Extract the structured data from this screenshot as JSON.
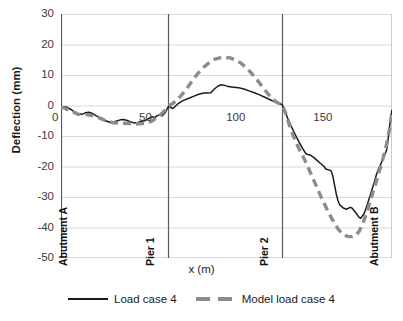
{
  "chart_data": {
    "type": "line",
    "title": "",
    "xlabel": "x (m)",
    "ylabel": "Deflection (mm)",
    "xlim": [
      0,
      190
    ],
    "ylim": [
      -50,
      30
    ],
    "grid": true,
    "legend_position": "bottom",
    "x_ticks": [
      {
        "value": 0,
        "label": "0"
      },
      {
        "value": 50,
        "label": "50"
      },
      {
        "value": 100,
        "label": "100"
      },
      {
        "value": 150,
        "label": "150"
      }
    ],
    "y_ticks": [
      {
        "value": 30,
        "label": "30"
      },
      {
        "value": 20,
        "label": "20"
      },
      {
        "value": 10,
        "label": "10"
      },
      {
        "value": 0,
        "label": "0"
      },
      {
        "value": -10,
        "label": "-10"
      },
      {
        "value": -20,
        "label": "-20"
      },
      {
        "value": -30,
        "label": "-30"
      },
      {
        "value": -40,
        "label": "-40"
      },
      {
        "value": -50,
        "label": "-50"
      }
    ],
    "annotations": [
      {
        "name": "abutment-a",
        "label": "Abutment A",
        "x": 0
      },
      {
        "name": "pier-1",
        "label": "Pier 1",
        "x": 61.5
      },
      {
        "name": "pier-2",
        "label": "Pier 2",
        "x": 127
      },
      {
        "name": "abutment-b",
        "label": "Abutment B",
        "x": 190
      }
    ],
    "series": [
      {
        "name": "Load case 4",
        "style": "solid",
        "color": "#1a1a1a",
        "points": [
          [
            0,
            -0.3
          ],
          [
            3,
            -0.5
          ],
          [
            6,
            -1.4
          ],
          [
            9,
            -2.6
          ],
          [
            12,
            -2.9
          ],
          [
            14,
            -2.4
          ],
          [
            16,
            -2.2
          ],
          [
            18,
            -2.6
          ],
          [
            20,
            -3.3
          ],
          [
            23,
            -4.2
          ],
          [
            26,
            -5.1
          ],
          [
            28,
            -5.5
          ],
          [
            30,
            -5.5
          ],
          [
            32,
            -5.1
          ],
          [
            34,
            -4.7
          ],
          [
            36,
            -4.6
          ],
          [
            38,
            -4.9
          ],
          [
            40,
            -5.4
          ],
          [
            42,
            -5.7
          ],
          [
            44,
            -5.6
          ],
          [
            46,
            -5.2
          ],
          [
            48,
            -5.0
          ],
          [
            50,
            -4.4
          ],
          [
            52,
            -3.7
          ],
          [
            54,
            -3.9
          ],
          [
            55,
            -3.4
          ],
          [
            57,
            -3.0
          ],
          [
            58,
            -3.4
          ],
          [
            60,
            -2.2
          ],
          [
            61.5,
            -0.4
          ],
          [
            63,
            -0.6
          ],
          [
            64,
            -1.0
          ],
          [
            65,
            -0.6
          ],
          [
            67,
            0.5
          ],
          [
            70,
            1.6
          ],
          [
            73,
            2.3
          ],
          [
            76,
            3.0
          ],
          [
            79,
            3.7
          ],
          [
            82,
            4.1
          ],
          [
            84,
            4.1
          ],
          [
            86,
            4.2
          ],
          [
            88,
            5.4
          ],
          [
            90,
            6.3
          ],
          [
            92,
            6.8
          ],
          [
            94,
            6.6
          ],
          [
            96,
            6.2
          ],
          [
            99,
            6.0
          ],
          [
            102,
            5.8
          ],
          [
            105,
            5.4
          ],
          [
            108,
            4.8
          ],
          [
            111,
            4.2
          ],
          [
            114,
            3.5
          ],
          [
            117,
            2.7
          ],
          [
            120,
            1.9
          ],
          [
            123,
            1.1
          ],
          [
            126,
            0.5
          ],
          [
            127,
            0.3
          ],
          [
            128,
            -1.2
          ],
          [
            130,
            -4.0
          ],
          [
            132,
            -6.6
          ],
          [
            134,
            -9.0
          ],
          [
            136,
            -11.3
          ],
          [
            138,
            -13.4
          ],
          [
            140,
            -15.3
          ],
          [
            141,
            -16.0
          ],
          [
            143,
            -16.2
          ],
          [
            145,
            -17.0
          ],
          [
            147,
            -18.0
          ],
          [
            149,
            -19.0
          ],
          [
            151,
            -20.0
          ],
          [
            152,
            -20.8
          ],
          [
            154,
            -21.2
          ],
          [
            155,
            -21.4
          ],
          [
            156,
            -23.0
          ],
          [
            157,
            -26.0
          ],
          [
            158,
            -29.0
          ],
          [
            159,
            -31.2
          ],
          [
            160,
            -32.6
          ],
          [
            162,
            -33.6
          ],
          [
            164,
            -34.0
          ],
          [
            166,
            -33.4
          ],
          [
            167,
            -33.6
          ],
          [
            169,
            -35.0
          ],
          [
            171,
            -36.6
          ],
          [
            172,
            -37.0
          ],
          [
            174,
            -35.4
          ],
          [
            176,
            -32.2
          ],
          [
            178,
            -28.5
          ],
          [
            180,
            -24.8
          ],
          [
            181,
            -22.8
          ],
          [
            182,
            -21.2
          ],
          [
            184,
            -18.6
          ],
          [
            186,
            -16.0
          ],
          [
            187,
            -14.4
          ],
          [
            188,
            -10.0
          ],
          [
            189,
            -5.0
          ],
          [
            190,
            -1.4
          ]
        ]
      },
      {
        "name": "Model load case 4",
        "style": "dashed",
        "color": "#8c8c8c",
        "points": [
          [
            0,
            -0.4
          ],
          [
            5,
            -1.6
          ],
          [
            10,
            -2.9
          ],
          [
            15,
            -3.0
          ],
          [
            20,
            -3.6
          ],
          [
            25,
            -4.8
          ],
          [
            30,
            -5.7
          ],
          [
            35,
            -5.8
          ],
          [
            40,
            -5.9
          ],
          [
            45,
            -6.0
          ],
          [
            50,
            -5.7
          ],
          [
            53,
            -4.8
          ],
          [
            56,
            -3.6
          ],
          [
            59,
            -2.0
          ],
          [
            61.5,
            -0.3
          ],
          [
            64,
            0.6
          ],
          [
            67,
            2.0
          ],
          [
            70,
            4.0
          ],
          [
            73,
            6.2
          ],
          [
            76,
            8.6
          ],
          [
            79,
            10.8
          ],
          [
            82,
            12.6
          ],
          [
            85,
            14.0
          ],
          [
            88,
            15.1
          ],
          [
            91,
            15.6
          ],
          [
            94,
            15.8
          ],
          [
            97,
            15.6
          ],
          [
            100,
            15.0
          ],
          [
            103,
            14.0
          ],
          [
            106,
            12.6
          ],
          [
            109,
            10.8
          ],
          [
            112,
            8.8
          ],
          [
            115,
            6.6
          ],
          [
            118,
            4.4
          ],
          [
            121,
            2.4
          ],
          [
            124,
            1.0
          ],
          [
            127,
            0.2
          ],
          [
            129,
            -2.6
          ],
          [
            131,
            -6.2
          ],
          [
            133,
            -9.4
          ],
          [
            135,
            -12.2
          ],
          [
            137,
            -14.6
          ],
          [
            139,
            -16.8
          ],
          [
            141,
            -19.2
          ],
          [
            143,
            -21.8
          ],
          [
            145,
            -24.4
          ],
          [
            147,
            -27.0
          ],
          [
            149,
            -29.6
          ],
          [
            151,
            -32.0
          ],
          [
            153,
            -34.4
          ],
          [
            155,
            -36.6
          ],
          [
            157,
            -38.6
          ],
          [
            159,
            -40.4
          ],
          [
            161,
            -41.8
          ],
          [
            163,
            -42.6
          ],
          [
            165,
            -43.0
          ],
          [
            167,
            -43.0
          ],
          [
            169,
            -42.6
          ],
          [
            171,
            -41.4
          ],
          [
            173,
            -39.0
          ],
          [
            175,
            -36.0
          ],
          [
            177,
            -32.4
          ],
          [
            179,
            -28.6
          ],
          [
            181,
            -24.8
          ],
          [
            183,
            -21.0
          ],
          [
            185,
            -17.0
          ],
          [
            187,
            -12.4
          ],
          [
            188.5,
            -8.0
          ],
          [
            190,
            -2.0
          ]
        ]
      }
    ]
  },
  "legend": {
    "entries": [
      {
        "label": "Load case 4",
        "style": "solid"
      },
      {
        "label": "Model load case 4",
        "style": "dashed"
      }
    ]
  },
  "colors": {
    "measured": "#1a1a1a",
    "model": "#8c8c8c",
    "grid": "#d9d9d9",
    "axis": "#808080",
    "marker_line": "#595959"
  }
}
